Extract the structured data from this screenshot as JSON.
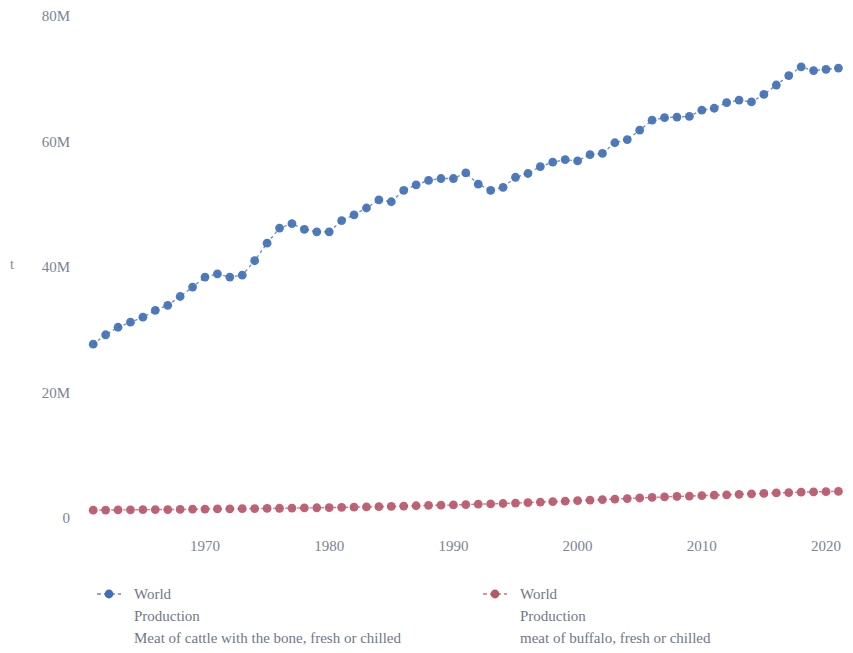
{
  "chart_data": {
    "type": "line",
    "title": "",
    "subtitle": "",
    "xlabel": "",
    "ylabel": "t",
    "xlim": [
      1960.2,
      2022.2
    ],
    "ylim": [
      0,
      80000000
    ],
    "grid": false,
    "legend_position": "bottom",
    "x_ticks": [
      "1970",
      "1980",
      "1990",
      "2000",
      "2010",
      "2020"
    ],
    "x_tick_values": [
      1970,
      1980,
      1990,
      2000,
      2010,
      2020
    ],
    "y_ticks": [
      "0",
      "20M",
      "40M",
      "60M",
      "80M"
    ],
    "y_tick_values": [
      0,
      20000000,
      40000000,
      60000000,
      80000000
    ],
    "x": [
      1961,
      1962,
      1963,
      1964,
      1965,
      1966,
      1967,
      1968,
      1969,
      1970,
      1971,
      1972,
      1973,
      1974,
      1975,
      1976,
      1977,
      1978,
      1979,
      1980,
      1981,
      1982,
      1983,
      1984,
      1985,
      1986,
      1987,
      1988,
      1989,
      1990,
      1991,
      1992,
      1993,
      1994,
      1995,
      1996,
      1997,
      1998,
      1999,
      2000,
      2001,
      2002,
      2003,
      2004,
      2005,
      2006,
      2007,
      2008,
      2009,
      2010,
      2011,
      2012,
      2013,
      2014,
      2015,
      2016,
      2017,
      2018,
      2019,
      2020,
      2021
    ],
    "series": [
      {
        "name": "World Production Meat of cattle with the bone, fresh or chilled",
        "legend_label": "World Production",
        "color": "#3f6fb5",
        "marker": "circle",
        "linestyle": "dashed",
        "values": [
          27700000,
          29200000,
          30400000,
          31200000,
          32000000,
          33100000,
          33900000,
          35300000,
          36800000,
          38400000,
          38900000,
          38400000,
          38700000,
          41000000,
          43800000,
          46200000,
          46900000,
          46000000,
          45600000,
          45600000,
          47400000,
          48300000,
          49400000,
          50700000,
          50400000,
          52200000,
          53100000,
          53800000,
          54100000,
          54100000,
          55000000,
          53200000,
          52200000,
          52700000,
          54300000,
          54900000,
          56000000,
          56700000,
          57100000,
          56900000,
          57900000,
          58100000,
          59800000,
          60300000,
          61800000,
          63400000,
          63800000,
          63900000,
          64000000,
          65000000,
          65300000,
          66200000,
          66600000,
          66300000,
          67500000,
          69000000,
          70500000,
          71900000,
          71300000,
          71500000,
          71700000
        ]
      },
      {
        "name": "World Production meat of buffalo, fresh or chilled",
        "legend_label": "World Production",
        "color": "#b8566a",
        "marker": "circle",
        "linestyle": "dashed",
        "values": [
          1250000,
          1270000,
          1280000,
          1300000,
          1320000,
          1340000,
          1350000,
          1370000,
          1400000,
          1420000,
          1440000,
          1460000,
          1480000,
          1500000,
          1520000,
          1550000,
          1580000,
          1600000,
          1630000,
          1660000,
          1700000,
          1740000,
          1770000,
          1810000,
          1850000,
          1900000,
          1950000,
          2000000,
          2040000,
          2080000,
          2140000,
          2200000,
          2250000,
          2310000,
          2380000,
          2450000,
          2530000,
          2600000,
          2680000,
          2760000,
          2850000,
          2930000,
          3020000,
          3100000,
          3190000,
          3280000,
          3360000,
          3430000,
          3490000,
          3560000,
          3630000,
          3700000,
          3780000,
          3850000,
          3920000,
          3990000,
          4050000,
          4110000,
          4160000,
          4200000,
          4230000
        ]
      }
    ],
    "caption": "Meat of cattle with the bone, fresh or chilled meat of buffalo, fresh or chilled"
  },
  "legend": {
    "entries": [
      {
        "label_line1": "World",
        "label_line2": "Production",
        "label_line3": "Meat of cattle with the bone, fresh or chilled",
        "color": "#3f6fb5"
      },
      {
        "label_line1": "World",
        "label_line2": "Production",
        "label_line3": "meat of buffalo, fresh or chilled",
        "color": "#b8566a"
      }
    ]
  },
  "axis": {
    "y_title": "t"
  },
  "colors": {
    "series_blue": "#3f6fb5",
    "series_red": "#b8566a",
    "text": "#7b8493",
    "background": "#ffffff"
  }
}
